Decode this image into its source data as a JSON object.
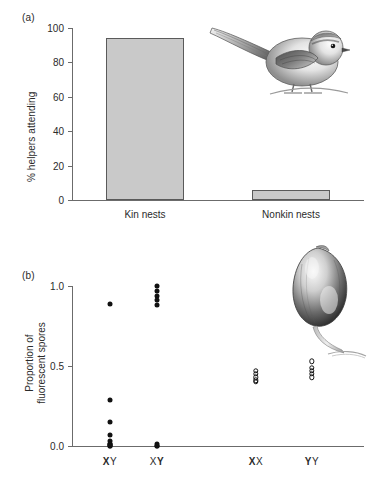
{
  "figure": {
    "panels": [
      {
        "tag": "(a)",
        "ylabel": "% helpers attending",
        "illustration": "long-tailed-tit-bird-illustration"
      },
      {
        "tag": "(b)",
        "ylabel_line1": "Proportion of",
        "ylabel_line2": "fluorescent spores",
        "illustration": "slime-mold-fruiting-body-illustration"
      }
    ]
  },
  "chart_data": [
    {
      "type": "bar",
      "title": "",
      "panel": "(a)",
      "categories": [
        "Kin nests",
        "Nonkin nests"
      ],
      "values": [
        94,
        6
      ],
      "xlabel": "",
      "ylabel": "% helpers attending",
      "ylim": [
        0,
        100
      ],
      "yticks": [
        0,
        20,
        40,
        60,
        80,
        100
      ],
      "ytick_labels": [
        "0",
        "20",
        "40",
        "60",
        "80",
        "100"
      ],
      "grid": false,
      "legend": "none",
      "bar_fill": "#c9c9c9",
      "bar_edge": "#5a5a5a"
    },
    {
      "type": "scatter",
      "title": "",
      "panel": "(b)",
      "categories": [
        "XY",
        "XY",
        "XX",
        "YY"
      ],
      "category_label_parts": [
        {
          "bold": "X",
          "regular": "Y"
        },
        {
          "regular_first": "X",
          "bold_second": "Y"
        },
        {
          "bold": "X",
          "regular": "X"
        },
        {
          "bold": "Y",
          "regular": "Y"
        }
      ],
      "xlabel": "",
      "ylabel": "Proportion of fluorescent spores",
      "ylim": [
        0.0,
        1.0
      ],
      "yticks": [
        0.0,
        0.5,
        1.0
      ],
      "ytick_labels": [
        "0.0",
        "0.5",
        "1.0"
      ],
      "grid": false,
      "legend": "none",
      "series": [
        {
          "name": "XY",
          "marker": "filled",
          "x_index": 0,
          "values": [
            0.89,
            0.29,
            0.15,
            0.07,
            0.03,
            0.015,
            0.01,
            0.005,
            0.0,
            0.0
          ]
        },
        {
          "name": "XY",
          "marker": "filled",
          "x_index": 1,
          "values": [
            1.0,
            0.97,
            0.94,
            0.91,
            0.88,
            0.01,
            0.0,
            0.0
          ]
        },
        {
          "name": "XX",
          "marker": "open",
          "x_index": 2,
          "values": [
            0.47,
            0.45,
            0.43,
            0.41,
            0.4
          ]
        },
        {
          "name": "YY",
          "marker": "open",
          "x_index": 3,
          "values": [
            0.53,
            0.49,
            0.47,
            0.45,
            0.43
          ]
        }
      ]
    }
  ]
}
